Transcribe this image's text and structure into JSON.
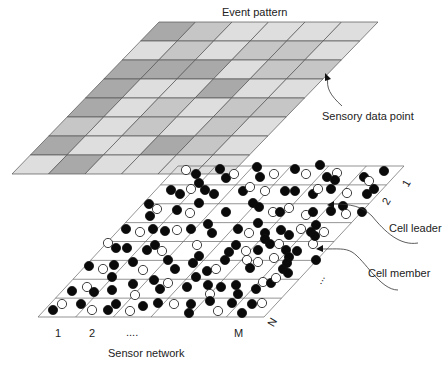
{
  "title": "Event pattern",
  "labels": {
    "sensory_data_point": "Sensory data point",
    "cell_leader": "Cell leader",
    "cell_member": "Cell member",
    "sensor_network": "Sensor network"
  },
  "axis": {
    "col_labels": [
      "1",
      "2",
      "....",
      "M"
    ],
    "row_labels": [
      "1",
      "2",
      "...",
      "N"
    ]
  },
  "event_grid": {
    "rows": 8,
    "cols": 6,
    "colors": {
      "D": "#a9a9a9",
      "M": "#c6c6c6",
      "L": "#dedede"
    },
    "shading": [
      [
        "D",
        "M",
        "L",
        "L",
        "L",
        "L"
      ],
      [
        "L",
        "M",
        "L",
        "M",
        "M",
        "L"
      ],
      [
        "D",
        "D",
        "D",
        "L",
        "M",
        "M"
      ],
      [
        "D",
        "L",
        "L",
        "D",
        "L",
        "L"
      ],
      [
        "D",
        "L",
        "M",
        "L",
        "M",
        "M"
      ],
      [
        "M",
        "L",
        "M",
        "L",
        "M",
        "L"
      ],
      [
        "D",
        "L",
        "L",
        "D",
        "M",
        "L"
      ],
      [
        "L",
        "D",
        "L",
        "L",
        "L",
        "L"
      ]
    ]
  },
  "sensor_grid": {
    "rows": 8,
    "cols": 6,
    "nodes": [
      [
        186,
        170,
        0
      ],
      [
        196,
        174,
        1
      ],
      [
        199,
        183,
        1
      ],
      [
        220,
        169,
        1
      ],
      [
        226,
        178,
        1
      ],
      [
        234,
        174,
        0
      ],
      [
        257,
        167,
        1
      ],
      [
        260,
        177,
        1
      ],
      [
        274,
        174,
        0
      ],
      [
        295,
        169,
        1
      ],
      [
        306,
        174,
        0
      ],
      [
        320,
        165,
        1
      ],
      [
        327,
        177,
        1
      ],
      [
        337,
        173,
        0
      ],
      [
        335,
        180,
        1
      ],
      [
        364,
        177,
        1
      ],
      [
        369,
        181,
        0
      ],
      [
        384,
        171,
        1
      ],
      [
        171,
        190,
        1
      ],
      [
        180,
        194,
        1
      ],
      [
        191,
        189,
        0
      ],
      [
        205,
        190,
        1
      ],
      [
        214,
        194,
        1
      ],
      [
        199,
        203,
        1
      ],
      [
        243,
        191,
        1
      ],
      [
        250,
        187,
        0
      ],
      [
        265,
        191,
        0
      ],
      [
        285,
        191,
        1
      ],
      [
        295,
        191,
        1
      ],
      [
        313,
        194,
        1
      ],
      [
        318,
        189,
        0
      ],
      [
        331,
        189,
        1
      ],
      [
        347,
        193,
        0
      ],
      [
        367,
        194,
        1
      ],
      [
        374,
        189,
        1
      ],
      [
        149,
        204,
        1
      ],
      [
        157,
        209,
        0
      ],
      [
        150,
        216,
        1
      ],
      [
        177,
        210,
        1
      ],
      [
        190,
        213,
        0
      ],
      [
        226,
        212,
        1
      ],
      [
        253,
        203,
        1
      ],
      [
        259,
        207,
        1
      ],
      [
        273,
        212,
        0
      ],
      [
        280,
        212,
        1
      ],
      [
        289,
        208,
        0
      ],
      [
        306,
        215,
        0
      ],
      [
        313,
        212,
        1
      ],
      [
        331,
        211,
        1
      ],
      [
        343,
        206,
        1
      ],
      [
        346,
        214,
        0
      ],
      [
        362,
        212,
        1
      ],
      [
        126,
        229,
        1
      ],
      [
        140,
        232,
        0
      ],
      [
        153,
        229,
        1
      ],
      [
        165,
        231,
        1
      ],
      [
        177,
        230,
        0
      ],
      [
        191,
        229,
        1
      ],
      [
        208,
        224,
        1
      ],
      [
        212,
        233,
        1
      ],
      [
        238,
        229,
        1
      ],
      [
        249,
        233,
        0
      ],
      [
        258,
        223,
        1
      ],
      [
        265,
        233,
        1
      ],
      [
        281,
        230,
        1
      ],
      [
        289,
        235,
        1
      ],
      [
        301,
        229,
        0
      ],
      [
        311,
        232,
        1
      ],
      [
        316,
        225,
        1
      ],
      [
        324,
        232,
        0
      ],
      [
        108,
        243,
        0
      ],
      [
        116,
        248,
        1
      ],
      [
        127,
        248,
        1
      ],
      [
        147,
        250,
        1
      ],
      [
        155,
        245,
        1
      ],
      [
        162,
        251,
        0
      ],
      [
        197,
        245,
        0
      ],
      [
        199,
        256,
        1
      ],
      [
        229,
        252,
        1
      ],
      [
        236,
        245,
        1
      ],
      [
        246,
        251,
        0
      ],
      [
        258,
        250,
        1
      ],
      [
        265,
        239,
        1
      ],
      [
        270,
        244,
        1
      ],
      [
        279,
        244,
        0
      ],
      [
        286,
        250,
        1
      ],
      [
        289,
        257,
        1
      ],
      [
        297,
        251,
        1
      ],
      [
        313,
        244,
        0
      ],
      [
        315,
        236,
        1
      ],
      [
        89,
        266,
        1
      ],
      [
        103,
        269,
        0
      ],
      [
        114,
        265,
        1
      ],
      [
        133,
        262,
        1
      ],
      [
        143,
        270,
        0
      ],
      [
        168,
        260,
        1
      ],
      [
        175,
        269,
        1
      ],
      [
        193,
        263,
        1
      ],
      [
        207,
        271,
        1
      ],
      [
        216,
        269,
        0
      ],
      [
        225,
        260,
        1
      ],
      [
        247,
        260,
        0
      ],
      [
        250,
        268,
        1
      ],
      [
        258,
        262,
        0
      ],
      [
        274,
        258,
        0
      ],
      [
        283,
        269,
        1
      ],
      [
        287,
        263,
        1
      ],
      [
        288,
        273,
        1
      ],
      [
        316,
        260,
        1
      ],
      [
        72,
        291,
        1
      ],
      [
        87,
        287,
        0
      ],
      [
        94,
        292,
        1
      ],
      [
        112,
        277,
        1
      ],
      [
        112,
        290,
        1
      ],
      [
        133,
        284,
        1
      ],
      [
        135,
        295,
        0
      ],
      [
        154,
        280,
        1
      ],
      [
        160,
        289,
        1
      ],
      [
        168,
        283,
        0
      ],
      [
        187,
        287,
        1
      ],
      [
        196,
        277,
        1
      ],
      [
        208,
        285,
        1
      ],
      [
        210,
        294,
        0
      ],
      [
        221,
        287,
        1
      ],
      [
        236,
        285,
        1
      ],
      [
        238,
        294,
        1
      ],
      [
        256,
        289,
        1
      ],
      [
        263,
        282,
        0
      ],
      [
        271,
        283,
        1
      ],
      [
        276,
        278,
        0
      ],
      [
        53,
        310,
        1
      ],
      [
        62,
        304,
        0
      ],
      [
        81,
        304,
        1
      ],
      [
        92,
        310,
        0
      ],
      [
        108,
        310,
        1
      ],
      [
        116,
        304,
        1
      ],
      [
        130,
        311,
        0
      ],
      [
        143,
        306,
        1
      ],
      [
        158,
        303,
        1
      ],
      [
        174,
        304,
        0
      ],
      [
        189,
        313,
        1
      ],
      [
        191,
        304,
        1
      ],
      [
        210,
        301,
        1
      ],
      [
        218,
        311,
        0
      ],
      [
        232,
        303,
        1
      ],
      [
        242,
        313,
        1
      ],
      [
        252,
        304,
        1
      ],
      [
        262,
        303,
        0
      ]
    ]
  }
}
